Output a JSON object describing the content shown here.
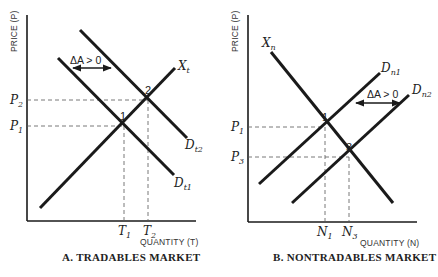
{
  "panels": [
    {
      "id": "A",
      "caption": "A.  TRADABLES MARKET",
      "y_axis_label": "PRICE (P)",
      "x_axis_label": "QUANTITY (T)",
      "curves": {
        "supply": {
          "name": "X",
          "sub": "t"
        },
        "demand_1": {
          "name": "D",
          "sub": "t1"
        },
        "demand_2": {
          "name": "D",
          "sub": "t2"
        }
      },
      "shift_label": "ΔA > 0",
      "equilibria": [
        {
          "label": "1",
          "price": "P",
          "price_sub": "1",
          "qty": "T",
          "qty_sub": "1"
        },
        {
          "label": "2",
          "price": "P",
          "price_sub": "2",
          "qty": "T",
          "qty_sub": "2"
        }
      ]
    },
    {
      "id": "B",
      "caption": "B.  NONTRADABLES MARKET",
      "y_axis_label": "PRICE (P)",
      "x_axis_label": "QUANTITY (N)",
      "curves": {
        "supply": {
          "name": "X",
          "sub": "n"
        },
        "demand_1": {
          "name": "D",
          "sub": "n1"
        },
        "demand_2": {
          "name": "D",
          "sub": "n2"
        }
      },
      "shift_label": "ΔA > 0",
      "equilibria": [
        {
          "label": "1",
          "price": "P",
          "price_sub": "1",
          "qty": "N",
          "qty_sub": "1"
        },
        {
          "label": "3",
          "price": "P",
          "price_sub": "3",
          "qty": "N",
          "qty_sub": "3"
        }
      ]
    }
  ]
}
